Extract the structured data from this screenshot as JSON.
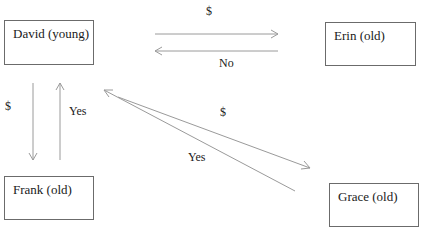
{
  "nodes": {
    "david": {
      "label": "David (young)"
    },
    "erin": {
      "label": "Erin (old)"
    },
    "frank": {
      "label": "Frank (old)"
    },
    "grace": {
      "label": "Grace (old)"
    }
  },
  "edges": [
    {
      "from": "David (young)",
      "to": "Erin (old)",
      "label": "$"
    },
    {
      "from": "Erin (old)",
      "to": "David (young)",
      "label": "No"
    },
    {
      "from": "David (young)",
      "to": "Frank (old)",
      "label": "$"
    },
    {
      "from": "Frank (old)",
      "to": "David (young)",
      "label": "Yes"
    },
    {
      "from": "David (young)",
      "to": "Grace (old)",
      "label": "$"
    },
    {
      "from": "Grace (old)",
      "to": "David (young)",
      "label": "Yes"
    }
  ],
  "arrow_color": "#9a9a9a"
}
